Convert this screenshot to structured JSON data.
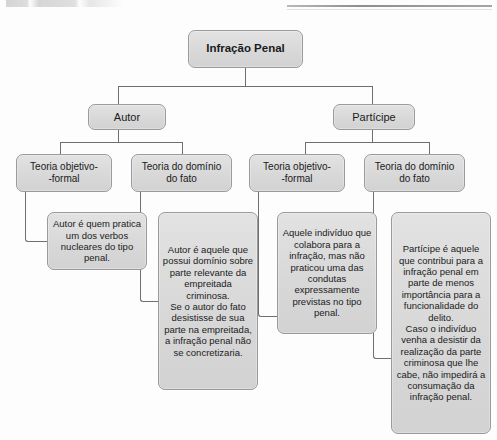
{
  "page": {
    "background_color": "#fdfdfd",
    "node_fill_color": "#dcdcdc",
    "node_border_color": "#9a9a9a",
    "connector_color": "#6f6f6f"
  },
  "artifacts": {
    "top_text_fragment": "",
    "top_rule_label": ""
  },
  "diagram": {
    "type": "tree",
    "root": {
      "id": "infracao-penal",
      "label": "Infração Penal"
    },
    "level2": [
      {
        "id": "autor",
        "label": "Autor"
      },
      {
        "id": "participe",
        "label": "Partícipe"
      }
    ],
    "level3": [
      {
        "id": "autor-teoria-objetivo-formal",
        "label": "Teoria objetivo-\n-formal",
        "parent": "autor"
      },
      {
        "id": "autor-teoria-dominio-fato",
        "label": "Teoria do domínio\ndo fato",
        "parent": "autor"
      },
      {
        "id": "participe-teoria-objetivo-formal",
        "label": "Teoria objetivo-\n-formal",
        "parent": "participe"
      },
      {
        "id": "participe-teoria-dominio-fato",
        "label": "Teoria do domínio\ndo fato",
        "parent": "participe"
      }
    ],
    "leaves": [
      {
        "id": "leaf-autor-objetivo-formal",
        "parent": "autor-teoria-objetivo-formal",
        "text": "Autor é quem pratica um dos verbos nucleares do tipo penal."
      },
      {
        "id": "leaf-autor-dominio-fato",
        "parent": "autor-teoria-dominio-fato",
        "text": "Autor é aquele que possui domínio sobre parte relevante da empreitada criminosa.\nSe o autor do fato desistisse de sua parte na empreitada, a infração penal não se concretizaria."
      },
      {
        "id": "leaf-participe-objetivo-formal",
        "parent": "participe-teoria-objetivo-formal",
        "text": "Aquele indivíduo que colabora para a infração, mas não praticou uma das condutas expressamente previstas no tipo penal."
      },
      {
        "id": "leaf-participe-dominio-fato",
        "parent": "participe-teoria-dominio-fato",
        "text": "Partícipe é aquele que contribui para a infração penal em parte de menos importância para a funcionalidade do delito.\nCaso o indivíduo venha a  desistir da realização da parte criminosa que lhe cabe, não impedirá a consumação da infração penal."
      }
    ]
  }
}
